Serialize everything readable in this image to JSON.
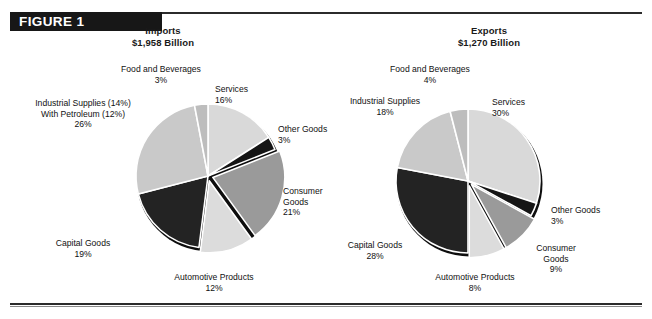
{
  "figure": {
    "banner_label": "FIGURE 1"
  },
  "panels": [
    {
      "id": "imports",
      "title": "Imports",
      "subtitle": "$1,958 Billion",
      "labels": {
        "food": {
          "name": "Food and Beverages",
          "pct": "3%"
        },
        "services": {
          "name": "Services",
          "pct": "16%"
        },
        "other": {
          "name": "Other Goods",
          "pct": "3%"
        },
        "consumer": {
          "name": "Consumer",
          "name2": "Goods",
          "pct": "21%"
        },
        "auto": {
          "name": "Automotive Products",
          "pct": "12%"
        },
        "capital": {
          "name": "Capital Goods",
          "pct": "19%"
        },
        "indust": {
          "name": "Industrial Supplies (14%)",
          "name2": "With Petroleum (12%)",
          "pct": "26%"
        }
      }
    },
    {
      "id": "exports",
      "title": "Exports",
      "subtitle": "$1,270 Billion",
      "labels": {
        "food": {
          "name": "Food and Beverages",
          "pct": "4%"
        },
        "services": {
          "name": "Services",
          "pct": "30%"
        },
        "other": {
          "name": "Other Goods",
          "pct": "3%"
        },
        "consumer": {
          "name": "Consumer",
          "name2": "Goods",
          "pct": "9%"
        },
        "auto": {
          "name": "Automotive Products",
          "pct": "8%"
        },
        "capital": {
          "name": "Capital Goods",
          "pct": "28%"
        },
        "indust": {
          "name": "Industrial Supplies",
          "pct": "18%"
        }
      }
    }
  ],
  "palette": {
    "services": "#d9d9d9",
    "other": "#151515",
    "consumer": "#9a9a9a",
    "auto": "#dcdcdc",
    "capital": "#232323",
    "indust": "#c9c9c9",
    "food": "#bdbdbd",
    "separator": "#ffffff",
    "text": "#111111",
    "banner_bg": "#171717",
    "rule": "#2b2b2b"
  },
  "chart_data": [
    {
      "type": "pie",
      "title": "Imports",
      "subtitle": "$1,958 Billion",
      "total_label": "$1,958 Billion",
      "units": "percent of total",
      "start_angle_deg": 0,
      "direction": "clockwise",
      "categories": [
        "Services",
        "Other Goods",
        "Consumer Goods",
        "Automotive Products",
        "Capital Goods",
        "Industrial Supplies With Petroleum",
        "Food and Beverages"
      ],
      "values": [
        16,
        3,
        21,
        12,
        19,
        26,
        3
      ],
      "annotations": [
        "Industrial Supplies (14%)",
        "With Petroleum (12%)"
      ],
      "legend": "none"
    },
    {
      "type": "pie",
      "title": "Exports",
      "subtitle": "$1,270 Billion",
      "total_label": "$1,270 Billion",
      "units": "percent of total",
      "start_angle_deg": 0,
      "direction": "clockwise",
      "categories": [
        "Services",
        "Other Goods",
        "Consumer Goods",
        "Automotive Products",
        "Capital Goods",
        "Industrial Supplies",
        "Food and Beverages"
      ],
      "values": [
        30,
        3,
        9,
        8,
        28,
        18,
        4
      ],
      "legend": "none"
    }
  ]
}
